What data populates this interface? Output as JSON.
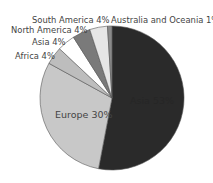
{
  "chart_data": {
    "type": "pie",
    "title": "",
    "start_angle_deg": 0,
    "direction": "clockwise",
    "slices": [
      {
        "label": "Asia",
        "value": 53,
        "display": "Asia 53%",
        "color": "#2a2a2a"
      },
      {
        "label": "Europe",
        "value": 30,
        "display": "Europe 30%",
        "color": "#c8c8c8"
      },
      {
        "label": "Africa",
        "value": 4,
        "display": "Africa 4%",
        "color": "#bdbdbd"
      },
      {
        "label": "Asia",
        "value": 4,
        "display": "Asia 4%",
        "color": "#ffffff"
      },
      {
        "label": "North America",
        "value": 4,
        "display": "North America 4%",
        "color": "#7a7a7a"
      },
      {
        "label": "South America",
        "value": 4,
        "display": "South America 4%",
        "color": "#e6e6e6"
      },
      {
        "label": "Australia and Oceania",
        "value": 1,
        "display": "Australia and Oceania 1%",
        "color": "#8a8a8a"
      }
    ],
    "legend": "none (labels on/around slices)"
  },
  "labels": {
    "south_america": "South America 4%",
    "australia": "Australia and Oceania 1%",
    "north_america": "North America 4%",
    "asia_small": "Asia 4%",
    "africa": "Africa 4%",
    "europe": "Europe 30%",
    "dark_slice": "Asia 53%"
  }
}
